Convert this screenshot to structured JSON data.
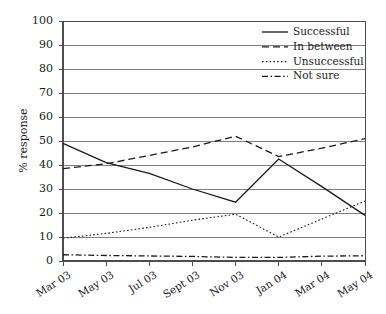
{
  "chart_data": {
    "type": "line",
    "title": "",
    "subtitle": "",
    "xlabel": "",
    "ylabel": "% response",
    "categories": [
      "Mar 03",
      "May 03",
      "Jul 03",
      "Sept 03",
      "Nov 03",
      "Jan 04",
      "Mar 04",
      "May 04"
    ],
    "ylim": [
      0,
      100
    ],
    "yticks": [
      0,
      10,
      20,
      30,
      40,
      50,
      60,
      70,
      80,
      90,
      100
    ],
    "grid": "horizontal",
    "legend_position": "top-right-inside",
    "series": [
      {
        "name": "Successful",
        "style": "solid",
        "values": [
          49,
          41,
          36.5,
          30,
          24.5,
          42.5,
          31,
          19
        ]
      },
      {
        "name": "In between",
        "style": "dashed",
        "values": [
          38.5,
          40.5,
          44,
          47.5,
          52,
          43.5,
          47,
          51
        ]
      },
      {
        "name": "Unsuccessful",
        "style": "dotted",
        "values": [
          9.5,
          11.5,
          14,
          17,
          19.5,
          10,
          17.5,
          25
        ]
      },
      {
        "name": "Not sure",
        "style": "dash-dot",
        "values": [
          2.6,
          2.3,
          2.1,
          1.9,
          1.5,
          1.5,
          2,
          2.2
        ]
      }
    ],
    "colors": {
      "axis": "#4d4d4d",
      "grid": "#808080",
      "series": "#1a1a1a",
      "background": "#ffffff"
    }
  }
}
